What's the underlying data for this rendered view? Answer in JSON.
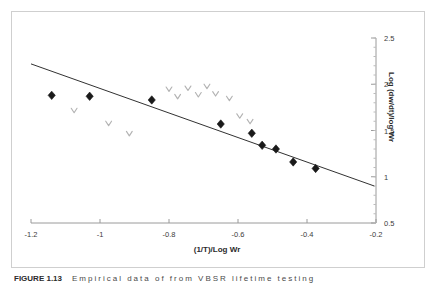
{
  "figure": {
    "caption_number": "FIGURE 1.13",
    "caption_text": "Empirical data of from VBSR lifetime testing"
  },
  "chart_data": {
    "type": "scatter",
    "title": "",
    "xlabel": "(1/T)/Log Wr",
    "ylabel": "Log (dw/dt)/log Wr",
    "xlim": [
      -1.2,
      -0.2
    ],
    "ylim": [
      0.5,
      2.5
    ],
    "xticks": [
      "-1.2",
      "-1",
      "-0.8",
      "-0.6",
      "-0.4",
      "-0.2"
    ],
    "xtick_values": [
      -1.2,
      -1.0,
      -0.8,
      -0.6,
      -0.4,
      -0.2
    ],
    "yticks": [
      "0.5",
      "1",
      "1.5",
      "2",
      "2.5"
    ],
    "ytick_values": [
      0.5,
      1.0,
      1.5,
      2.0,
      2.5
    ],
    "y_axis_position": "right",
    "grid": false,
    "legend": "none",
    "minor_ticks": true,
    "series": [
      {
        "name": "Series 1",
        "marker": "filled-diamond",
        "color": "#1a1a1a",
        "points": [
          {
            "x": -1.14,
            "y": 1.88
          },
          {
            "x": -1.03,
            "y": 1.87
          },
          {
            "x": -0.85,
            "y": 1.83
          },
          {
            "x": -0.65,
            "y": 1.57
          },
          {
            "x": -0.56,
            "y": 1.47
          },
          {
            "x": -0.53,
            "y": 1.34
          },
          {
            "x": -0.49,
            "y": 1.3
          },
          {
            "x": -0.44,
            "y": 1.16
          },
          {
            "x": -0.375,
            "y": 1.09
          }
        ]
      },
      {
        "name": "Series 2",
        "marker": "open-diamond",
        "color": "#b3b3b3",
        "points": [
          {
            "x": -1.075,
            "y": 1.72
          },
          {
            "x": -0.975,
            "y": 1.58
          },
          {
            "x": -0.915,
            "y": 1.47
          },
          {
            "x": -0.8,
            "y": 1.95
          },
          {
            "x": -0.775,
            "y": 1.87
          },
          {
            "x": -0.745,
            "y": 1.96
          },
          {
            "x": -0.715,
            "y": 1.89
          },
          {
            "x": -0.69,
            "y": 1.98
          },
          {
            "x": -0.665,
            "y": 1.9
          },
          {
            "x": -0.625,
            "y": 1.85
          },
          {
            "x": -0.595,
            "y": 1.66
          },
          {
            "x": -0.565,
            "y": 1.6
          }
        ]
      }
    ],
    "trendline": {
      "name": "Linear fit",
      "color": "#1a1a1a",
      "x0": -1.2,
      "y0": 2.22,
      "x1": -0.205,
      "y1": 0.9
    }
  }
}
